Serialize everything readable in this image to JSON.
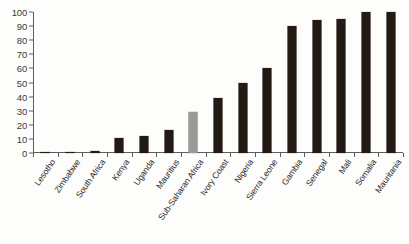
{
  "chart_data": {
    "type": "bar",
    "title": "",
    "subtitle": "",
    "xlabel": "",
    "ylabel": "",
    "ylim": [
      0,
      100
    ],
    "yticks": [
      0,
      10,
      20,
      30,
      40,
      50,
      60,
      70,
      80,
      90,
      100
    ],
    "grid": false,
    "legend": null,
    "categories": [
      "Lesotho",
      "Zimbabwe",
      "South Africa",
      "Kenya",
      "Uganda",
      "Mauritius",
      "Sub-Saharan Africa",
      "Ivory Coast",
      "Nigeria",
      "Sierra Leone",
      "Gambia",
      "Senegal",
      "Mali",
      "Somalia",
      "Mauritania"
    ],
    "values": [
      0,
      1,
      1.5,
      11,
      12,
      16,
      29,
      39,
      50,
      60,
      90,
      94,
      95,
      100,
      100
    ],
    "bar_colors": [
      "#241a14",
      "#241a14",
      "#241a14",
      "#241a14",
      "#241a14",
      "#241a14",
      "#9a9a98",
      "#241a14",
      "#241a14",
      "#241a14",
      "#241a14",
      "#241a14",
      "#241a14",
      "#241a14",
      "#241a14"
    ],
    "highlight_index": 6,
    "colors": {
      "bar_dark": "#241a14",
      "bar_highlight": "#9a9a98",
      "axis": "#5d5d5d",
      "text": "#2e2e2e",
      "background": "#fdfdfc"
    }
  }
}
